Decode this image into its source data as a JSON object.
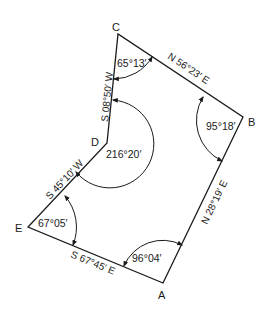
{
  "diagram": {
    "type": "closed traverse",
    "vertices": [
      {
        "id": "A",
        "label": "A",
        "x": 163,
        "y": 283
      },
      {
        "id": "B",
        "label": "B",
        "x": 243,
        "y": 117
      },
      {
        "id": "C",
        "label": "C",
        "x": 118,
        "y": 34
      },
      {
        "id": "D",
        "label": "D",
        "x": 107,
        "y": 143
      },
      {
        "id": "E",
        "label": "E",
        "x": 28,
        "y": 227
      }
    ],
    "bearings": {
      "AB": "N 28°19′ E",
      "BC": "N 56°23′ E",
      "CD": "S 08°50′ W",
      "DE": "S 45°10′ W",
      "EA": "S 67°45′ E"
    },
    "interior_angles": {
      "A": "96°04′",
      "B": "95°18′",
      "C": "65°13′",
      "D": "216°20′",
      "E": "67°05′"
    }
  }
}
